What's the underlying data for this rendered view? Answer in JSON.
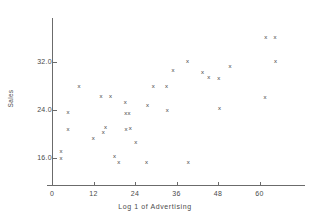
{
  "chart_data": {
    "type": "scatter",
    "title": "",
    "xlabel": "Log 1 of Advertising",
    "ylabel": "Sales",
    "xlim": [
      -2,
      70
    ],
    "ylim": [
      11.0,
      38.5
    ],
    "xticks": [
      0,
      12,
      24,
      36,
      48,
      60
    ],
    "xtick_labels": [
      "0",
      "12",
      "24",
      "36",
      "48",
      "60"
    ],
    "yticks": [
      16.0,
      24.0,
      32.0
    ],
    "ytick_labels": [
      "16.0",
      "24.0",
      "32.0"
    ],
    "grid": false,
    "legend": null,
    "marker": "x",
    "marker_color": "#3a3a3a",
    "points": [
      {
        "x": 2.6,
        "y": 17.1
      },
      {
        "x": 2.6,
        "y": 16.0
      },
      {
        "x": 4.6,
        "y": 23.6
      },
      {
        "x": 4.6,
        "y": 20.8
      },
      {
        "x": 7.8,
        "y": 28.0
      },
      {
        "x": 11.9,
        "y": 19.4
      },
      {
        "x": 14.2,
        "y": 26.4
      },
      {
        "x": 14.8,
        "y": 20.4
      },
      {
        "x": 15.5,
        "y": 21.1
      },
      {
        "x": 16.9,
        "y": 26.3
      },
      {
        "x": 18.1,
        "y": 16.3
      },
      {
        "x": 19.3,
        "y": 15.4
      },
      {
        "x": 21.2,
        "y": 25.3
      },
      {
        "x": 21.3,
        "y": 23.5
      },
      {
        "x": 22.3,
        "y": 23.5
      },
      {
        "x": 21.4,
        "y": 20.8
      },
      {
        "x": 22.6,
        "y": 21.0
      },
      {
        "x": 24.2,
        "y": 18.7
      },
      {
        "x": 27.3,
        "y": 15.4
      },
      {
        "x": 27.6,
        "y": 24.9
      },
      {
        "x": 29.3,
        "y": 28.0
      },
      {
        "x": 33.1,
        "y": 28.0
      },
      {
        "x": 33.3,
        "y": 24.0
      },
      {
        "x": 35.0,
        "y": 30.6
      },
      {
        "x": 39.2,
        "y": 32.1
      },
      {
        "x": 39.4,
        "y": 15.4
      },
      {
        "x": 43.5,
        "y": 30.4
      },
      {
        "x": 45.3,
        "y": 29.5
      },
      {
        "x": 48.2,
        "y": 29.4
      },
      {
        "x": 48.4,
        "y": 24.3
      },
      {
        "x": 51.5,
        "y": 31.3
      },
      {
        "x": 61.8,
        "y": 36.1
      },
      {
        "x": 61.6,
        "y": 26.1
      },
      {
        "x": 64.5,
        "y": 36.1
      },
      {
        "x": 64.6,
        "y": 32.1
      }
    ]
  }
}
